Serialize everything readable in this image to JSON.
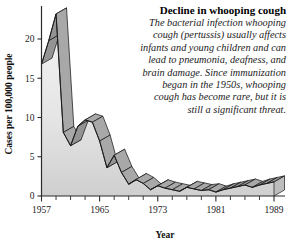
{
  "caption": {
    "title": "Decline in whooping cough",
    "body": "The bacterial infection whooping cough (pertussis) usually affects infants and young children and can lead to pneumonia, deafness, and brain damage. Since immunization began in the 1950s, whooping cough has become rare, but it is still a significant threat."
  },
  "colors": {
    "area_fill_light": "#ececec",
    "area_fill_dark": "#d2d2d2",
    "ribbon_top": "#a8a8a8",
    "ribbon_side": "#949494",
    "outline": "#1a1a1a",
    "axis": "#2b2b2b",
    "text": "#1a1a1a"
  },
  "chart_data": {
    "type": "area",
    "title": "Decline in whooping cough",
    "xlabel": "Year",
    "ylabel": "Cases per 100,000 people",
    "xlim": [
      1957,
      1990
    ],
    "ylim": [
      0,
      24
    ],
    "grid": false,
    "legend": false,
    "x_tick_labels": [
      "1957",
      "1965",
      "1973",
      "1981",
      "1989"
    ],
    "x_tick_values": [
      1957,
      1965,
      1973,
      1981,
      1989
    ],
    "x_minor_tick_values": [
      1959,
      1961,
      1963,
      1967,
      1969,
      1971,
      1975,
      1977,
      1979,
      1983,
      1985,
      1987
    ],
    "y_tick_labels": [
      "0",
      "5",
      "10",
      "15",
      "20"
    ],
    "y_tick_values": [
      0,
      5,
      10,
      15,
      20
    ],
    "series": [
      {
        "name": "Cases per 100,000 people",
        "x": [
          1957,
          1958,
          1959,
          1960,
          1961,
          1962,
          1963,
          1964,
          1965,
          1966,
          1967,
          1968,
          1969,
          1970,
          1971,
          1972,
          1973,
          1974,
          1975,
          1976,
          1977,
          1978,
          1979,
          1980,
          1981,
          1982,
          1983,
          1984,
          1985,
          1986,
          1987,
          1988,
          1989
        ],
        "values": [
          16.8,
          19.8,
          23.2,
          8.1,
          6.4,
          8.9,
          9.7,
          9.4,
          7.0,
          3.6,
          5.2,
          3.0,
          1.5,
          2.1,
          1.6,
          0.8,
          1.3,
          1.0,
          0.8,
          0.6,
          1.1,
          0.9,
          0.7,
          0.8,
          0.5,
          0.8,
          1.0,
          1.2,
          1.4,
          1.1,
          1.4,
          1.6,
          1.8
        ]
      }
    ]
  }
}
